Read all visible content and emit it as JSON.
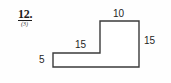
{
  "problem": {
    "number": "12.",
    "marks": "(3)"
  },
  "figure": {
    "shape_name": "l-shaped-polygon",
    "stroke_color": "#3b3b3b",
    "fill_color": "#ffffff",
    "vertices": [
      [
        53,
        53
      ],
      [
        100,
        53
      ],
      [
        100,
        21
      ],
      [
        139,
        21
      ],
      [
        139,
        67
      ],
      [
        53,
        67
      ]
    ]
  },
  "labels": {
    "top": "10",
    "right": "15",
    "middle": "15",
    "left": "5"
  },
  "chart_data": {
    "type": "diagram",
    "title": "",
    "shape": "L-shaped polygon (composite rectangle)",
    "dimensions": [
      {
        "name": "top-edge",
        "value": 10,
        "orientation": "horizontal",
        "position": "top of tall section"
      },
      {
        "name": "right-edge",
        "value": 15,
        "orientation": "vertical",
        "position": "right side of tall section"
      },
      {
        "name": "middle-edge",
        "value": 15,
        "orientation": "horizontal",
        "position": "top of low section"
      },
      {
        "name": "left-edge",
        "value": 5,
        "orientation": "vertical",
        "position": "left side of low section"
      }
    ],
    "labeled_values": [
      10,
      15,
      15,
      5
    ]
  }
}
